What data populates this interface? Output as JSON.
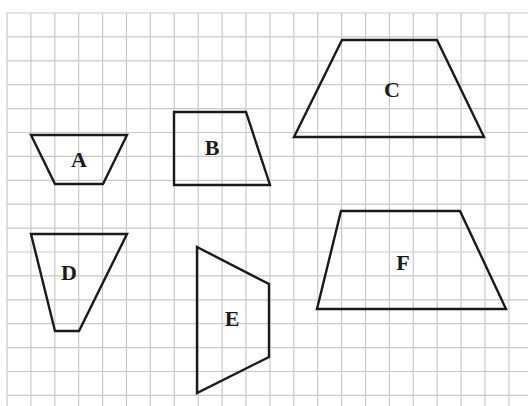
{
  "diagram": {
    "type": "grid_with_quadrilaterals",
    "grid": {
      "origin_x": 7,
      "origin_y": 13,
      "cell_size": 23.9,
      "columns": 22,
      "rows": 17,
      "line_color": "#c9c9c9"
    },
    "stroke_color": "#1a1a1a",
    "shapes": [
      {
        "id": "A",
        "label": "A",
        "points": [
          [
            31,
            135
          ],
          [
            127,
            135
          ],
          [
            103,
            184
          ],
          [
            55,
            184
          ]
        ],
        "label_pos": [
          79,
          162
        ]
      },
      {
        "id": "B",
        "label": "B",
        "points": [
          [
            174,
            112
          ],
          [
            246,
            112
          ],
          [
            270,
            185
          ],
          [
            174,
            185
          ]
        ],
        "label_pos": [
          212,
          150
        ]
      },
      {
        "id": "C",
        "label": "C",
        "points": [
          [
            342,
            40
          ],
          [
            437,
            40
          ],
          [
            484,
            137
          ],
          [
            294,
            137
          ]
        ],
        "label_pos": [
          392,
          92
        ]
      },
      {
        "id": "D",
        "label": "D",
        "points": [
          [
            31,
            234
          ],
          [
            127,
            234
          ],
          [
            79,
            331
          ],
          [
            55,
            331
          ]
        ],
        "label_pos": [
          69,
          275
        ]
      },
      {
        "id": "E",
        "label": "E",
        "points": [
          [
            197,
            247
          ],
          [
            269,
            284
          ],
          [
            269,
            357
          ],
          [
            197,
            393
          ]
        ],
        "label_pos": [
          232,
          321
        ]
      },
      {
        "id": "F",
        "label": "F",
        "points": [
          [
            341,
            211
          ],
          [
            460,
            211
          ],
          [
            506,
            309
          ],
          [
            317,
            309
          ]
        ],
        "label_pos": [
          403,
          265
        ]
      }
    ]
  }
}
